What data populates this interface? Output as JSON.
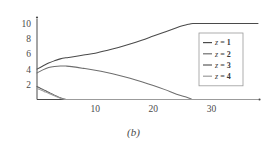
{
  "figure": {
    "caption": "(b)"
  },
  "chart_data": {
    "type": "line",
    "title": "",
    "xlabel": "",
    "ylabel": "",
    "xlim": [
      0,
      38
    ],
    "ylim": [
      0,
      10.6
    ],
    "grid": false,
    "legend_position": "right-center",
    "xticks": [
      10,
      20,
      30
    ],
    "yticks": [
      2,
      4,
      6,
      8,
      10
    ],
    "xtick_labels": [
      "10",
      "20",
      "30"
    ],
    "ytick_labels": [
      "2",
      "4",
      "6",
      "8",
      "10"
    ],
    "series": [
      {
        "name": "z = 1",
        "label_prefix": "z",
        "label_value": "1",
        "color": "#4a4a4a",
        "x": [
          0,
          1,
          2,
          3,
          4,
          5,
          6,
          8,
          10,
          12,
          14,
          16,
          18,
          20,
          22,
          24,
          25,
          26,
          26.8,
          28,
          30,
          34,
          38
        ],
        "y": [
          4.0,
          4.4,
          4.8,
          5.1,
          5.35,
          5.5,
          5.6,
          5.85,
          6.1,
          6.45,
          6.85,
          7.3,
          7.8,
          8.35,
          8.9,
          9.45,
          9.7,
          9.9,
          10.0,
          10.0,
          10.0,
          10.0,
          10.0
        ]
      },
      {
        "name": "z = 2",
        "label_prefix": "z",
        "label_value": "2",
        "color": "#6e6e6e",
        "x": [
          0,
          1,
          2,
          3,
          4,
          5,
          6,
          8,
          10,
          12,
          14,
          16,
          18,
          20,
          22,
          24,
          25.5,
          26.5,
          27,
          30,
          34,
          38
        ],
        "y": [
          3.5,
          3.9,
          4.2,
          4.35,
          4.42,
          4.4,
          4.33,
          4.1,
          3.85,
          3.55,
          3.2,
          2.8,
          2.35,
          1.85,
          1.3,
          0.7,
          0.35,
          0.08,
          0.0,
          0.0,
          0.0,
          0.0
        ]
      },
      {
        "name": "z = 3",
        "label_prefix": "z",
        "label_value": "3",
        "color": "#5a5a5a",
        "x": [
          0,
          0.5,
          1,
          1.5,
          2,
          2.5,
          3,
          3.5,
          4,
          4.5,
          5,
          6,
          10,
          20,
          30,
          38
        ],
        "y": [
          1.7,
          1.52,
          1.33,
          1.14,
          0.95,
          0.77,
          0.58,
          0.4,
          0.22,
          0.09,
          0.0,
          0.0,
          0.0,
          0.0,
          0.0,
          0.0
        ]
      },
      {
        "name": "z = 4",
        "label_prefix": "z",
        "label_value": "4",
        "color": "#9b9b9b",
        "x": [
          0,
          0.5,
          1,
          1.5,
          2,
          2.5,
          3,
          3.5,
          4,
          4.5,
          5,
          6,
          10,
          20,
          30,
          38
        ],
        "y": [
          1.45,
          1.3,
          1.14,
          0.97,
          0.81,
          0.65,
          0.49,
          0.33,
          0.18,
          0.07,
          0.0,
          0.0,
          0.0,
          0.0,
          0.0,
          0.0
        ]
      }
    ]
  }
}
